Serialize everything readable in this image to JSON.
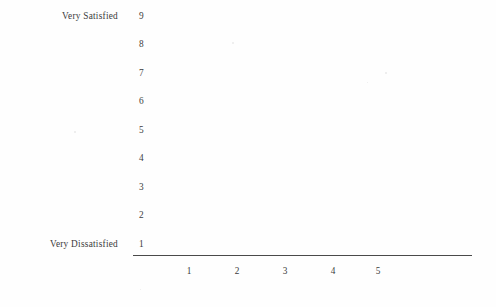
{
  "page": {
    "background_color": "#fefefe",
    "text_color": "#3c3c3c",
    "axis_color": "#4a4a4a"
  },
  "chart_data": {
    "type": "scatter",
    "title": "",
    "subtitle": "",
    "xlabel": "",
    "ylabel": "",
    "grid": false,
    "legend": null,
    "annotations": [],
    "note": "Blank response-scale grid: axes and tick labels drawn, no data points plotted.",
    "series": [],
    "x": [
      1,
      2,
      3,
      4,
      5
    ],
    "y": [
      1,
      2,
      3,
      4,
      5,
      6,
      7,
      8,
      9
    ],
    "xlim": [
      1,
      5
    ],
    "ylim": [
      1,
      9
    ],
    "x_tick_labels": [
      "1",
      "2",
      "3",
      "4",
      "5"
    ],
    "y_tick_labels": [
      "9",
      "8",
      "7",
      "6",
      "5",
      "4",
      "3",
      "2",
      "1"
    ],
    "y_axis_anchors": {
      "high": "Very Satisfied",
      "low": "Very Dissatisfied"
    }
  },
  "y_axis": {
    "anchor_high_label": "Very Satisfied",
    "anchor_low_label": "Very Dissatisfied",
    "ticks": [
      {
        "value": "9",
        "top": 11
      },
      {
        "value": "8",
        "top": 39
      },
      {
        "value": "7",
        "top": 68
      },
      {
        "value": "6",
        "top": 96
      },
      {
        "value": "5",
        "top": 125
      },
      {
        "value": "4",
        "top": 153
      },
      {
        "value": "3",
        "top": 182
      },
      {
        "value": "2",
        "top": 210
      },
      {
        "value": "1",
        "top": 239
      }
    ]
  },
  "x_axis": {
    "ticks": [
      {
        "value": "1",
        "left": 189
      },
      {
        "value": "2",
        "left": 237
      },
      {
        "value": "3",
        "left": 285
      },
      {
        "value": "4",
        "left": 333
      },
      {
        "value": "5",
        "left": 378
      }
    ]
  },
  "specks": [
    {
      "left": 232,
      "top": 42,
      "size": 2.0
    },
    {
      "left": 385,
      "top": 72,
      "size": 1.6
    },
    {
      "left": 367,
      "top": 82,
      "size": 1.4
    },
    {
      "left": 74,
      "top": 131,
      "size": 1.5
    },
    {
      "left": 140,
      "top": 289,
      "size": 1.4
    }
  ]
}
